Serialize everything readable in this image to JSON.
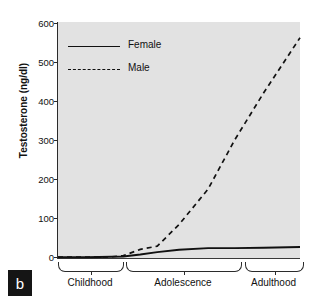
{
  "panel_label": "b",
  "axes": {
    "ylabel": "Testosterone (ng/dl)",
    "yticks": [
      "600",
      "500",
      "400",
      "300",
      "200",
      "100",
      "0"
    ]
  },
  "legend": {
    "items": [
      {
        "label": "Female",
        "style": "solid"
      },
      {
        "label": "Male",
        "style": "dashed"
      }
    ]
  },
  "stages": [
    {
      "label": "Childhood"
    },
    {
      "label": "Adolescence"
    },
    {
      "label": "Adulthood"
    }
  ],
  "colors": {
    "plot_background": "#e2e2e2",
    "line": "#111111",
    "axis": "#2b2b2b",
    "panel_badge": "#151515"
  },
  "chart_data": {
    "type": "line",
    "title": "",
    "xlabel": "",
    "ylabel": "Testosterone (ng/dl)",
    "ylim": [
      0,
      600
    ],
    "xlim": [
      0,
      100
    ],
    "grid": false,
    "legend_position": "top-left",
    "x_stage_ranges": {
      "Childhood": [
        0,
        27
      ],
      "Adolescence": [
        29,
        77
      ],
      "Adulthood": [
        79,
        100
      ]
    },
    "x": [
      0,
      12,
      22,
      27,
      34,
      41,
      50,
      62,
      73,
      85,
      100
    ],
    "series": [
      {
        "name": "Female",
        "style": "solid",
        "values": [
          2,
          2,
          3,
          4,
          9,
          15,
          21,
          25,
          25,
          26,
          28
        ]
      },
      {
        "name": "Male",
        "style": "dashed",
        "values": [
          2,
          2,
          3,
          6,
          22,
          30,
          85,
          175,
          300,
          420,
          560
        ]
      }
    ],
    "annotations": [
      {
        "text": "b",
        "role": "panel-label"
      }
    ]
  }
}
